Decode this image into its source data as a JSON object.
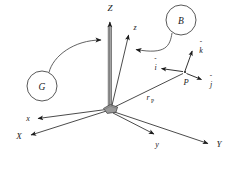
{
  "figure": {
    "type": "vector-diagram",
    "background_color": "#ffffff",
    "line_color": "#2b2b2b",
    "hub_fill_color": "#9a9a9a",
    "hub_stroke_color": "#3a3a3a"
  },
  "callouts": [
    {
      "id": "callout-g",
      "label": "G",
      "cx": 42,
      "cy": 86,
      "r": 15,
      "points_to": "Z-axis of global frame"
    },
    {
      "id": "callout-b",
      "label": "B",
      "cx": 181,
      "cy": 20,
      "r": 15,
      "points_to": "z-axis of body frame"
    }
  ],
  "origin": {
    "label": "",
    "x": 110,
    "y": 109
  },
  "global_frame": {
    "name": "G",
    "axes": [
      {
        "label": "X",
        "tip_x": 27,
        "tip_y": 136
      },
      {
        "label": "Y",
        "tip_x": 213,
        "tip_y": 144
      },
      {
        "label": "Z",
        "tip_x": 110,
        "tip_y": 14
      }
    ]
  },
  "body_frame": {
    "name": "B",
    "axes": [
      {
        "label": "x",
        "tip_x": 33,
        "tip_y": 119
      },
      {
        "label": "y",
        "tip_x": 158,
        "tip_y": 138
      },
      {
        "label": "z",
        "tip_x": 130,
        "tip_y": 30
      }
    ]
  },
  "point": {
    "label": "P",
    "x": 185,
    "y": 72,
    "unit_vectors": [
      {
        "label": "i",
        "hat": "ˆ",
        "tip_x": 157,
        "tip_y": 68,
        "name": "i-hat"
      },
      {
        "label": "j",
        "hat": "ˆ",
        "tip_x": 205,
        "tip_y": 80,
        "name": "j-hat"
      },
      {
        "label": "k",
        "hat": "ˆ",
        "tip_x": 193,
        "tip_y": 47,
        "name": "k-hat"
      }
    ]
  },
  "position_vector": {
    "label": "r",
    "subscript": "P",
    "from": "origin",
    "to": "P",
    "label_x": 148,
    "label_y": 97
  }
}
